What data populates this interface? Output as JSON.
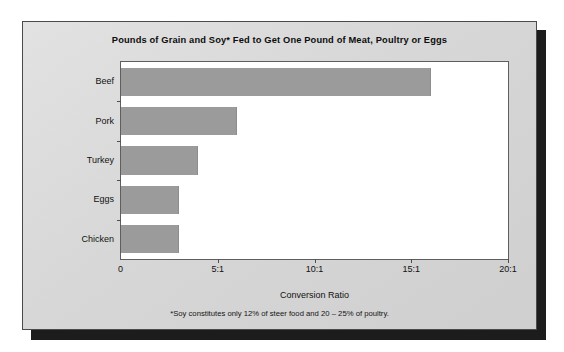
{
  "figure": {
    "title": "Pounds of Grain and Soy* Fed to Get One Pound of Meat, Poultry or Eggs",
    "footnote": "*Soy  constitutes only 12% of steer food and 20 – 25% of poultry.",
    "bar_color": "#9b9b9b",
    "panel_color": "#d9d9d9",
    "plot_background": "#ffffff",
    "shadow_color": "#1c1c1c"
  },
  "chart_data": {
    "type": "bar",
    "orientation": "horizontal",
    "title": "Pounds of Grain and Soy* Fed to Get One Pound of Meat, Poultry or Eggs",
    "xlabel": "Conversion Ratio",
    "ylabel": "",
    "categories": [
      "Beef",
      "Pork",
      "Turkey",
      "Eggs",
      "Chicken"
    ],
    "values": [
      16,
      6,
      4,
      3,
      3
    ],
    "xlim": [
      0,
      20
    ],
    "xticks": [
      0,
      5,
      10,
      15,
      20
    ],
    "xtick_labels": [
      "0",
      "5:1",
      "10:1",
      "15:1",
      "20:1"
    ],
    "grid": false,
    "legend": false,
    "series_color": "#9b9b9b",
    "annotations": [
      "*Soy  constitutes only 12% of steer food and 20 – 25% of poultry."
    ]
  }
}
